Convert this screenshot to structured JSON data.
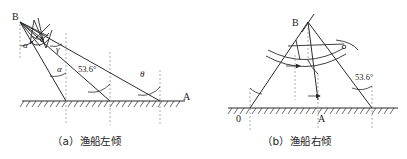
{
  "figure": {
    "title_visible": false,
    "panels": [
      {
        "id": "panel-a",
        "caption": "（a）渔船左倾",
        "point_labels": [
          {
            "name": "B",
            "text": "B",
            "x": 12,
            "y": 20
          },
          {
            "name": "A",
            "text": "A",
            "x": 183,
            "y": 100
          }
        ],
        "angle_labels": [
          {
            "name": "alpha-upper",
            "text": "α",
            "x": 23,
            "y": 48
          },
          {
            "name": "gamma",
            "text": "γ",
            "x": 56,
            "y": 52
          },
          {
            "name": "alpha-lower",
            "text": "α",
            "x": 57,
            "y": 72
          },
          {
            "name": "theta",
            "text": "θ",
            "x": 140,
            "y": 77
          }
        ],
        "measure_labels": [
          {
            "name": "angle-53-6",
            "text": "53.6°",
            "x": 78,
            "y": 72
          }
        ]
      },
      {
        "id": "panel-b",
        "caption": "（b）渔船右倾",
        "point_labels": [
          {
            "name": "B",
            "text": "B",
            "x": 292,
            "y": 26
          },
          {
            "name": "O",
            "text": "0",
            "x": 236,
            "y": 122
          },
          {
            "name": "A",
            "text": "A",
            "x": 318,
            "y": 122
          }
        ],
        "angle_labels": [],
        "measure_labels": [
          {
            "name": "angle-53-6",
            "text": "53.6°",
            "x": 355,
            "y": 80
          }
        ]
      }
    ],
    "colors": {
      "line": "#2b2b2b",
      "ground": "#2b2b2b",
      "dashed": "#8a8a8a",
      "text": "#1c1c1c",
      "background": "#ffffff"
    },
    "geometry_note": "Two line drawings of a fishing boat mast inclination: left-heeling and right-heeling, each with a hatched ground line, dashed vertical reference lines and angle arcs."
  }
}
